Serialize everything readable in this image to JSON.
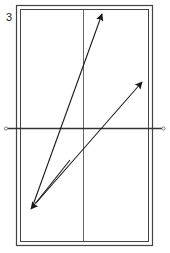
{
  "figure": {
    "label": "3",
    "stroke_color": "#2a2a2a",
    "arrows": [
      {
        "name": "arrow-up-right-steep",
        "direction": "up-right"
      },
      {
        "name": "arrow-up-right-shallow",
        "direction": "up-right"
      },
      {
        "name": "arrow-down-left",
        "direction": "down-left"
      }
    ]
  }
}
